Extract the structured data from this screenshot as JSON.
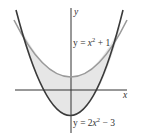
{
  "figure": {
    "type": "area-between-curves",
    "axis_labels": {
      "x": "x",
      "y": "y"
    },
    "curves": [
      {
        "name": "upper",
        "equation": "y = x^2 + 1",
        "label_prefix": "y = ",
        "label_var": "x",
        "label_exp": "2",
        "label_suffix": " + 1",
        "color": "#9a9a9a"
      },
      {
        "name": "lower",
        "equation": "y = 2x^2 - 3",
        "label_prefix": "y = 2",
        "label_var": "x",
        "label_exp": "2",
        "label_suffix": " − 3",
        "color": "#3a3a3a"
      }
    ],
    "shaded_region": {
      "between": [
        "y = x^2 + 1",
        "y = 2x^2 - 3"
      ],
      "x_range": [
        -2,
        2
      ],
      "fill": "#e6e6e6"
    },
    "colors": {
      "axis": "#333333",
      "shade": "#e6e6e6"
    }
  }
}
